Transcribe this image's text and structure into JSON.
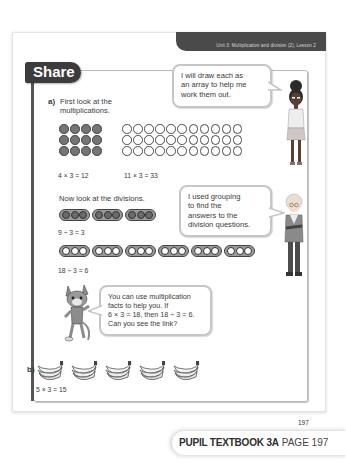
{
  "header": {
    "unit_title": "Unit 3: Multiplication and division (2), Lesson 2"
  },
  "section": {
    "title": "Share"
  },
  "part_a": {
    "label": "a)",
    "intro_line1": "First look at the",
    "intro_line2": "multiplications.",
    "arrays": [
      {
        "rows": 3,
        "cols": 4,
        "style": "filled",
        "equation": "4 × 3 = 12"
      },
      {
        "rows": 3,
        "cols": 11,
        "style": "empty",
        "equation": "11 × 3 = 33"
      }
    ],
    "divisions_intro": "Now look at the divisions.",
    "divisions": [
      {
        "groups": 3,
        "per_group": 3,
        "style": "filled",
        "equation": "9 ÷ 3 = 3"
      },
      {
        "groups": 6,
        "per_group": 3,
        "style": "empty",
        "equation": "18 ÷ 3 = 6"
      }
    ]
  },
  "bubbles": {
    "girl": [
      "I will draw each as",
      "an array to help me",
      "work them out."
    ],
    "boy": [
      "I used grouping",
      "to find the",
      "answers to the",
      "division questions."
    ],
    "cat": [
      "You can use multiplication",
      "facts to help you. If",
      "6 × 3 = 18, then 18 ÷ 3 = 6.",
      "Can you see the link?"
    ]
  },
  "part_b": {
    "label": "b)",
    "banana_bunches": 5,
    "equation": "5 × 3 = 15"
  },
  "footer": {
    "page_number": "197",
    "book_label": "PUPIL TEXTBOOK 3A",
    "page_label": "PAGE 197"
  },
  "colors": {
    "header_bg": "#4a4a4a",
    "tab_bg": "#3c3c3c",
    "frame_border": "#b9b9b9",
    "dot_filled": "#757575"
  }
}
